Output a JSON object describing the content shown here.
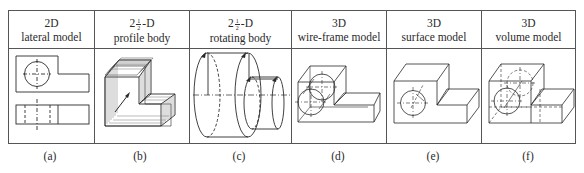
{
  "panels": [
    {
      "id": "a",
      "title_prefix": "2D",
      "title_suffix": "",
      "subtitle": "lateral model",
      "caption": "(a)"
    },
    {
      "id": "b",
      "title_prefix": "2",
      "fraction": {
        "num": "1",
        "den": "2"
      },
      "title_suffix": "-D",
      "subtitle": "profile body",
      "caption": "(b)"
    },
    {
      "id": "c",
      "title_prefix": "2",
      "fraction": {
        "num": "1",
        "den": "2"
      },
      "title_suffix": "-D",
      "subtitle": "rotating body",
      "caption": "(c)"
    },
    {
      "id": "d",
      "title_prefix": "3D",
      "title_suffix": "",
      "subtitle": "wire-frame model",
      "caption": "(d)"
    },
    {
      "id": "e",
      "title_prefix": "3D",
      "title_suffix": "",
      "subtitle": "surface model",
      "caption": "(e)"
    },
    {
      "id": "f",
      "title_prefix": "3D",
      "title_suffix": "",
      "subtitle": "volume model",
      "caption": "(f)"
    }
  ],
  "colors": {
    "line": "#2a2a2a",
    "border": "#555555",
    "background": "#ffffff"
  }
}
